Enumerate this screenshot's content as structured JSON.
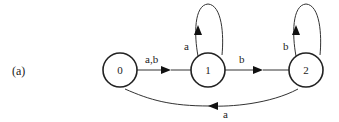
{
  "figure_label": "(a)",
  "states": [
    {
      "id": "0",
      "label": "0"
    },
    {
      "id": "1",
      "label": "1"
    },
    {
      "id": "2",
      "label": "2"
    }
  ],
  "transitions": [
    {
      "from": "0",
      "to": "1",
      "label": "a,b"
    },
    {
      "from": "1",
      "to": "1",
      "label": "a"
    },
    {
      "from": "1",
      "to": "2",
      "label": "b"
    },
    {
      "from": "2",
      "to": "2",
      "label": "b"
    },
    {
      "from": "2",
      "to": "0",
      "label": "a"
    }
  ],
  "colors": {
    "stroke": "#222222",
    "background": "#ffffff"
  }
}
